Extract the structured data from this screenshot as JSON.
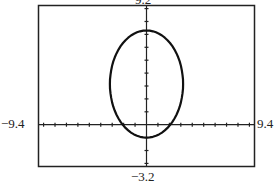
{
  "chart_data": {
    "type": "line",
    "title": "",
    "window": {
      "xmin": -9.4,
      "xmax": 9.4,
      "ymin": -3.2,
      "ymax": 9.2
    },
    "xscl": 1,
    "yscl": 1,
    "tick_labels": {
      "top": "9.2",
      "bottom": "−3.2",
      "left": "−9.4",
      "right": "9.4"
    },
    "xlabel": "",
    "ylabel": "",
    "grid": false,
    "series": [
      {
        "name": "curve",
        "shape": "closed oval",
        "approx_points": [
          {
            "x": 0,
            "y": 7.3
          },
          {
            "x": 2.0,
            "y": 6.5
          },
          {
            "x": 3.0,
            "y": 4.5
          },
          {
            "x": 3.2,
            "y": 2.5
          },
          {
            "x": 2.3,
            "y": 0
          },
          {
            "x": 1.0,
            "y": -1.0
          },
          {
            "x": 0,
            "y": -1.0
          },
          {
            "x": -1.0,
            "y": -1.0
          },
          {
            "x": -2.2,
            "y": 0
          },
          {
            "x": -3.2,
            "y": 2.5
          },
          {
            "x": -3.0,
            "y": 4.5
          },
          {
            "x": -2.0,
            "y": 6.5
          },
          {
            "x": 0,
            "y": 7.3
          }
        ]
      }
    ]
  },
  "labels": {
    "top": "9.2",
    "bottom": "−3.2",
    "left": "−9.4",
    "right": "9.4"
  }
}
